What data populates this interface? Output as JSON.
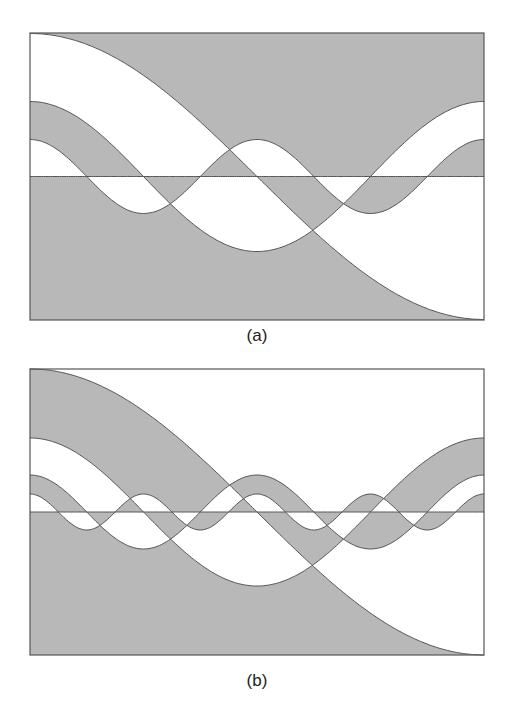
{
  "colors": {
    "shade": "#b8b8b8",
    "line": "#555555",
    "background": "#ffffff"
  },
  "panels": [
    {
      "label": "(a)",
      "box": {
        "x": 30,
        "y": 33,
        "w": 454,
        "h": 287
      },
      "label_pos": {
        "x": 257,
        "y": 326
      },
      "shade_parity": 0,
      "curves": [
        {
          "k": 1,
          "amp": 143
        },
        {
          "k": 2,
          "amp": 75
        },
        {
          "k": 4,
          "amp": 37
        },
        {
          "k": 0,
          "amp": 0
        }
      ]
    },
    {
      "label": "(b)",
      "box": {
        "x": 30,
        "y": 369,
        "w": 454,
        "h": 286
      },
      "label_pos": {
        "x": 257,
        "y": 671
      },
      "shade_parity": 1,
      "curves": [
        {
          "k": 1,
          "amp": 143
        },
        {
          "k": 2,
          "amp": 74
        },
        {
          "k": 4,
          "amp": 37
        },
        {
          "k": 8,
          "amp": 18
        },
        {
          "k": 0,
          "amp": 0
        }
      ]
    }
  ]
}
